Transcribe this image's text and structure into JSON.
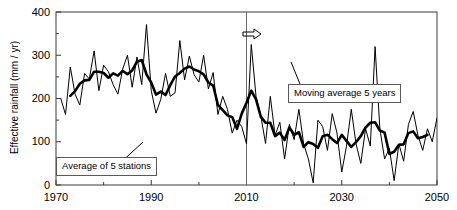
{
  "chart_data": {
    "type": "line",
    "title": "",
    "xlabel": "",
    "ylabel": "Effective rainfall (mm / yr)",
    "xlim": [
      1970,
      2050
    ],
    "ylim": [
      0,
      400
    ],
    "xticks": [
      1970,
      1990,
      2010,
      2030,
      2050
    ],
    "xticklabels": [
      "1970",
      "1990",
      "2010",
      "2030",
      "2050"
    ],
    "yticks": [
      0,
      100,
      200,
      300,
      400
    ],
    "yticklabels": [
      "0",
      "100",
      "200",
      "300",
      "400"
    ],
    "yminorticks": [
      50,
      150,
      250,
      350
    ],
    "xminorticks": [
      1980,
      2000,
      2020,
      2040
    ],
    "grid": false,
    "legend_position": "inline-callouts",
    "annotations": [
      {
        "name": "average-of-5-stations",
        "text": "Average of 5 stations",
        "x": 1975,
        "y": 35
      },
      {
        "name": "moving-average-5-years",
        "text": "Moving average 5 years",
        "x": 2018,
        "y": 225
      },
      {
        "name": "divider-year",
        "text": "2010",
        "x": 2010
      },
      {
        "name": "forecast-arrow",
        "text": "⇨",
        "x": 2012,
        "y": 370
      }
    ],
    "series": [
      {
        "name": "Average of 5 stations",
        "style": "thin",
        "color": "#000000",
        "x": [
          1971,
          1972,
          1973,
          1974,
          1975,
          1976,
          1977,
          1978,
          1979,
          1980,
          1981,
          1982,
          1983,
          1984,
          1985,
          1986,
          1987,
          1988,
          1989,
          1990,
          1991,
          1992,
          1993,
          1994,
          1995,
          1996,
          1997,
          1998,
          1999,
          2000,
          2001,
          2002,
          2003,
          2004,
          2005,
          2006,
          2007,
          2008,
          2009,
          2010,
          2011,
          2012,
          2013,
          2014,
          2015,
          2016,
          2017,
          2018,
          2019,
          2020,
          2021,
          2022,
          2023,
          2024,
          2025,
          2026,
          2027,
          2028,
          2029,
          2030,
          2031,
          2032,
          2033,
          2034,
          2035,
          2036,
          2037,
          2038,
          2039,
          2040,
          2041,
          2042,
          2043,
          2044,
          2045,
          2046,
          2047,
          2048,
          2049,
          2050
        ],
        "values": [
          200,
          163,
          273,
          210,
          185,
          258,
          245,
          310,
          218,
          277,
          262,
          232,
          210,
          268,
          300,
          226,
          296,
          232,
          371,
          218,
          166,
          198,
          258,
          205,
          213,
          334,
          243,
          298,
          255,
          238,
          300,
          222,
          260,
          163,
          205,
          175,
          120,
          150,
          135,
          95,
          325,
          205,
          160,
          96,
          205,
          115,
          145,
          60,
          140,
          105,
          175,
          95,
          60,
          5,
          150,
          135,
          80,
          165,
          120,
          30,
          90,
          175,
          95,
          50,
          130,
          90,
          320,
          130,
          60,
          85,
          10,
          95,
          55,
          140,
          170,
          115,
          80,
          130,
          100,
          155
        ]
      },
      {
        "name": "Moving average 5 years",
        "style": "thick",
        "color": "#000000",
        "x": [
          1973,
          1974,
          1975,
          1976,
          1977,
          1978,
          1979,
          1980,
          1981,
          1982,
          1983,
          1984,
          1985,
          1986,
          1987,
          1988,
          1989,
          1990,
          1991,
          1992,
          1993,
          1994,
          1995,
          1996,
          1997,
          1998,
          1999,
          2000,
          2001,
          2002,
          2003,
          2004,
          2005,
          2006,
          2007,
          2008,
          2009,
          2010,
          2011,
          2012,
          2013,
          2014,
          2015,
          2016,
          2017,
          2018,
          2019,
          2020,
          2021,
          2022,
          2023,
          2024,
          2025,
          2026,
          2027,
          2028,
          2029,
          2030,
          2031,
          2032,
          2033,
          2034,
          2035,
          2036,
          2037,
          2038,
          2039,
          2040,
          2041,
          2042,
          2043,
          2044,
          2045,
          2046,
          2047,
          2048
        ],
        "values": [
          206,
          217,
          234,
          242,
          243,
          262,
          262,
          259,
          248,
          258,
          253,
          264,
          256,
          265,
          285,
          289,
          256,
          237,
          209,
          216,
          208,
          231,
          251,
          259,
          269,
          274,
          267,
          263,
          256,
          237,
          230,
          185,
          173,
          161,
          157,
          130,
          165,
          190,
          218,
          198,
          158,
          144,
          144,
          113,
          121,
          104,
          133,
          116,
          122,
          88,
          99,
          95,
          86,
          113,
          116,
          106,
          97,
          116,
          102,
          88,
          99,
          113,
          133,
          144,
          145,
          126,
          121,
          72,
          77,
          93,
          94,
          120,
          124,
          108,
          111,
          116
        ]
      }
    ]
  },
  "callouts": {
    "stations": "Average of 5 stations",
    "moving": "Moving average 5 years"
  },
  "axis": {
    "ylabel": "Effective rainfall (mm / yr)"
  }
}
